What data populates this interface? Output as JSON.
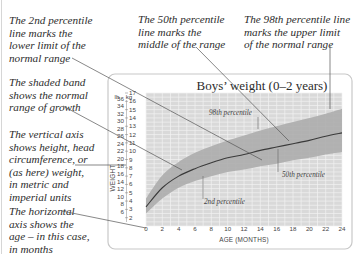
{
  "callouts": {
    "p2": "The 2nd percentile\nline marks the\nlower limit of the\nnormal range",
    "p50": "The 50th percentile\nline marks the\nmiddle of the range",
    "p98": "The 98th percentile line\nmarks the upper limit\nof the normal range",
    "band": "The shaded band\nshows the normal\nrange of growth",
    "vertical_axis": "The vertical axis\nshows height, head\ncircumference, or\n(as here) weight,\nin metric and\nimperial units",
    "horizontal_axis": "The horizontal\naxis shows the\nage – in this case,\nin months"
  },
  "chart": {
    "title": "Boys’ weight (0–2 years)",
    "y_axis_label": "WEIGHT",
    "x_axis_label": "AGE (MONTHS)",
    "lb_unit": "lb",
    "kg_unit": "kg",
    "lb_ticks": [
      "36",
      "34",
      "32",
      "30",
      "28",
      "26",
      "24",
      "22",
      "20",
      "18",
      "16",
      "14",
      "12",
      "10",
      "8",
      "6"
    ],
    "kg_ticks": [
      "17",
      "16",
      "15",
      "14",
      "13",
      "12",
      "11",
      "10",
      "9",
      "8",
      "7",
      "6",
      "5",
      "4",
      "3",
      "2"
    ],
    "x_ticks": [
      "0",
      "2",
      "4",
      "6",
      "8",
      "10",
      "12",
      "14",
      "16",
      "18",
      "20",
      "22",
      "24"
    ],
    "labels": {
      "p98": "98th percentile",
      "p50": "50th percentile",
      "p2": "2nd percentile"
    }
  },
  "chart_data": {
    "type": "area",
    "title": "Boys’ weight (0–2 years)",
    "xlabel": "AGE (MONTHS)",
    "ylabel": "WEIGHT",
    "y_units": [
      "lb",
      "kg"
    ],
    "x": [
      0,
      2,
      4,
      6,
      8,
      10,
      12,
      14,
      16,
      18,
      20,
      22,
      24
    ],
    "xlim": [
      0,
      24
    ],
    "ylim_kg": [
      1,
      17
    ],
    "ylim_lb": [
      2,
      36
    ],
    "grid": true,
    "legend": "inline labels",
    "series": [
      {
        "name": "98th percentile",
        "values": [
          4.3,
          7.1,
          8.7,
          9.8,
          10.6,
          11.3,
          11.9,
          12.5,
          13.0,
          13.5,
          14.0,
          14.5,
          15.1
        ]
      },
      {
        "name": "50th percentile",
        "values": [
          3.3,
          5.6,
          7.0,
          7.9,
          8.6,
          9.2,
          9.6,
          10.1,
          10.5,
          10.9,
          11.3,
          11.8,
          12.2
        ]
      },
      {
        "name": "2nd percentile",
        "values": [
          2.5,
          4.3,
          5.6,
          6.4,
          7.0,
          7.5,
          7.8,
          8.2,
          8.5,
          8.9,
          9.2,
          9.6,
          9.9
        ]
      }
    ],
    "band": "shaded area between 2nd and 98th percentile = normal range of growth"
  },
  "colors": {
    "grid_bg": "#d9d9d9",
    "grid_line": "#f2f2f2",
    "band": "#a9a9a9",
    "median_line": "#3a3a3a",
    "frame": "#c8c8c8",
    "leader": "#555555"
  }
}
